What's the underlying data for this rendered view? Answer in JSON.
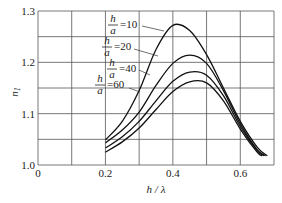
{
  "chart_data": {
    "type": "line",
    "title": "",
    "xlabel": "h / λ",
    "ylabel": "n₁",
    "xlim": [
      0,
      0.7
    ],
    "ylim": [
      1.0,
      1.3
    ],
    "grid": true,
    "x_ticks": [
      "0",
      "0.2",
      "0.4",
      "0.6"
    ],
    "y_ticks": [
      "1.0",
      "1.1",
      "1.2",
      "1.3"
    ],
    "legend_position": "inline-labels-left",
    "series": [
      {
        "name": "h/a = 10",
        "label_value": "=10",
        "x": [
          0.2,
          0.25,
          0.3,
          0.35,
          0.4,
          0.45,
          0.5,
          0.55,
          0.6,
          0.65,
          0.68
        ],
        "y": [
          1.049,
          1.085,
          1.145,
          1.225,
          1.272,
          1.262,
          1.215,
          1.15,
          1.085,
          1.035,
          1.018
        ]
      },
      {
        "name": "h/a = 20",
        "label_value": "=20",
        "x": [
          0.2,
          0.25,
          0.3,
          0.35,
          0.4,
          0.45,
          0.5,
          0.55,
          0.6,
          0.65,
          0.675
        ],
        "y": [
          1.043,
          1.068,
          1.103,
          1.155,
          1.198,
          1.214,
          1.198,
          1.145,
          1.08,
          1.03,
          1.018
        ]
      },
      {
        "name": "h/a = 40",
        "label_value": "=40",
        "x": [
          0.2,
          0.25,
          0.3,
          0.35,
          0.4,
          0.45,
          0.5,
          0.55,
          0.6,
          0.65,
          0.67
        ],
        "y": [
          1.033,
          1.055,
          1.085,
          1.125,
          1.163,
          1.181,
          1.175,
          1.135,
          1.075,
          1.028,
          1.018
        ]
      },
      {
        "name": "h/a = 60",
        "label_value": "=60",
        "x": [
          0.2,
          0.25,
          0.3,
          0.35,
          0.4,
          0.45,
          0.5,
          0.55,
          0.6,
          0.65,
          0.665
        ],
        "y": [
          1.025,
          1.045,
          1.072,
          1.108,
          1.143,
          1.162,
          1.16,
          1.125,
          1.07,
          1.025,
          1.018
        ]
      }
    ]
  },
  "labels": {
    "frac_num": "h",
    "frac_den": "a"
  }
}
